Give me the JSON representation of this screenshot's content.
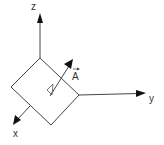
{
  "diagram": {
    "type": "3d-coordinate-system",
    "axes": [
      {
        "name": "z",
        "label": "z"
      },
      {
        "name": "y",
        "label": "y"
      },
      {
        "name": "x",
        "label": "x"
      }
    ],
    "vector": {
      "label": "A",
      "has_arrow_accent": true
    },
    "surface": "square-plate",
    "colors": {
      "stroke": "#444444",
      "fill": "#111111",
      "background": "#ffffff"
    }
  }
}
